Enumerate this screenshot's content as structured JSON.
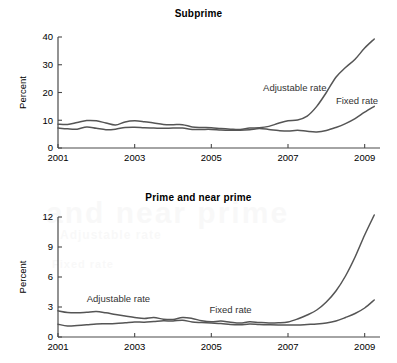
{
  "figure": {
    "background_color": "#ffffff",
    "line_color": "#555555",
    "axis_color": "#4a4a4a",
    "watermark": {
      "line1": "Subprime",
      "line2": "and near prime",
      "line3": "Adjustable rate",
      "line4": "Fixed rate"
    }
  },
  "chart_data": [
    {
      "type": "line",
      "title": "Subprime",
      "xlabel": "",
      "ylabel": "Percent",
      "xlim": [
        2001.0,
        2009.4
      ],
      "ylim": [
        0,
        40
      ],
      "xticks": [
        2001,
        2003,
        2005,
        2007,
        2009
      ],
      "xticklabels": [
        "2001",
        "2003",
        "2005",
        "2007",
        "2009"
      ],
      "yticks": [
        0,
        10,
        20,
        30,
        40
      ],
      "yticklabels": [
        "0",
        "10",
        "20",
        "30",
        "40"
      ],
      "grid": false,
      "legend_position": "inline-annotations",
      "annotations": [
        {
          "text": "Adjustable rate",
          "x": 2006.35,
          "y": 20.5
        },
        {
          "text": "Fixed rate",
          "x": 2008.25,
          "y": 15.8
        }
      ],
      "series": [
        {
          "name": "Adjustable rate",
          "x": [
            2001.0,
            2001.25,
            2001.5,
            2001.75,
            2002.0,
            2002.25,
            2002.5,
            2002.75,
            2003.0,
            2003.25,
            2003.5,
            2003.75,
            2004.0,
            2004.25,
            2004.5,
            2004.75,
            2005.0,
            2005.25,
            2005.5,
            2005.75,
            2006.0,
            2006.25,
            2006.5,
            2006.75,
            2007.0,
            2007.25,
            2007.5,
            2007.75,
            2008.0,
            2008.25,
            2008.5,
            2008.75,
            2009.0,
            2009.25
          ],
          "values": [
            8.6,
            8.5,
            9.2,
            9.9,
            9.8,
            9.0,
            8.3,
            9.4,
            9.8,
            9.5,
            9.0,
            8.5,
            8.4,
            8.4,
            7.6,
            7.4,
            7.3,
            7.0,
            6.8,
            6.7,
            7.2,
            7.3,
            7.8,
            8.9,
            9.8,
            10.1,
            11.5,
            15.0,
            20.0,
            25.5,
            29.0,
            32.0,
            36.0,
            39.3
          ]
        },
        {
          "name": "Fixed rate",
          "x": [
            2001.0,
            2001.25,
            2001.5,
            2001.75,
            2002.0,
            2002.25,
            2002.5,
            2002.75,
            2003.0,
            2003.25,
            2003.5,
            2003.75,
            2004.0,
            2004.25,
            2004.5,
            2004.75,
            2005.0,
            2005.25,
            2005.5,
            2005.75,
            2006.0,
            2006.25,
            2006.5,
            2006.75,
            2007.0,
            2007.25,
            2007.5,
            2007.75,
            2008.0,
            2008.25,
            2008.5,
            2008.75,
            2009.0,
            2009.25
          ],
          "values": [
            7.2,
            6.9,
            6.8,
            7.6,
            7.1,
            6.6,
            6.8,
            7.4,
            7.5,
            7.3,
            7.2,
            7.1,
            7.2,
            7.2,
            6.7,
            6.7,
            6.7,
            6.5,
            6.4,
            6.4,
            6.6,
            7.0,
            6.7,
            6.3,
            6.1,
            6.4,
            6.0,
            5.8,
            6.3,
            7.4,
            8.8,
            10.6,
            12.9,
            15.0
          ]
        }
      ]
    },
    {
      "type": "line",
      "title": "Prime and near prime",
      "xlabel": "",
      "ylabel": "Percent",
      "xlim": [
        2001.0,
        2009.4
      ],
      "ylim": [
        0,
        12
      ],
      "xticks": [
        2001,
        2003,
        2005,
        2007,
        2009
      ],
      "xticklabels": [
        "2001",
        "2003",
        "2005",
        "2007",
        "2009"
      ],
      "yticks": [
        0,
        3,
        6,
        9,
        12
      ],
      "yticklabels": [
        "0",
        "3",
        "6",
        "9",
        "12"
      ],
      "grid": false,
      "legend_position": "inline-annotations",
      "annotations": [
        {
          "text": "Adjustable rate",
          "x": 2001.75,
          "y": 3.55
        },
        {
          "text": "Fixed rate",
          "x": 2004.95,
          "y": 2.45
        }
      ],
      "series": [
        {
          "name": "Adjustable rate",
          "x": [
            2001.0,
            2001.25,
            2001.5,
            2001.75,
            2002.0,
            2002.25,
            2002.5,
            2002.75,
            2003.0,
            2003.25,
            2003.5,
            2003.75,
            2004.0,
            2004.25,
            2004.5,
            2004.75,
            2005.0,
            2005.25,
            2005.5,
            2005.75,
            2006.0,
            2006.25,
            2006.5,
            2006.75,
            2007.0,
            2007.25,
            2007.5,
            2007.75,
            2008.0,
            2008.25,
            2008.5,
            2008.75,
            2009.0,
            2009.25
          ],
          "values": [
            2.62,
            2.45,
            2.42,
            2.48,
            2.55,
            2.42,
            2.25,
            2.1,
            1.95,
            1.85,
            1.95,
            1.78,
            1.75,
            1.95,
            1.85,
            1.62,
            1.52,
            1.6,
            1.48,
            1.4,
            1.52,
            1.45,
            1.4,
            1.42,
            1.5,
            1.8,
            2.2,
            2.7,
            3.5,
            4.6,
            6.1,
            8.0,
            10.2,
            12.2
          ]
        },
        {
          "name": "Fixed rate",
          "x": [
            2001.0,
            2001.25,
            2001.5,
            2001.75,
            2002.0,
            2002.25,
            2002.5,
            2002.75,
            2003.0,
            2003.25,
            2003.5,
            2003.75,
            2004.0,
            2004.25,
            2004.5,
            2004.75,
            2005.0,
            2005.25,
            2005.5,
            2005.75,
            2006.0,
            2006.25,
            2006.5,
            2006.75,
            2007.0,
            2007.25,
            2007.5,
            2007.75,
            2008.0,
            2008.25,
            2008.5,
            2008.75,
            2009.0,
            2009.25
          ],
          "values": [
            1.28,
            1.1,
            1.15,
            1.22,
            1.3,
            1.32,
            1.35,
            1.42,
            1.5,
            1.48,
            1.55,
            1.62,
            1.6,
            1.68,
            1.5,
            1.45,
            1.4,
            1.35,
            1.25,
            1.22,
            1.3,
            1.25,
            1.22,
            1.2,
            1.2,
            1.2,
            1.25,
            1.3,
            1.4,
            1.6,
            1.95,
            2.35,
            2.9,
            3.7
          ]
        }
      ]
    }
  ]
}
